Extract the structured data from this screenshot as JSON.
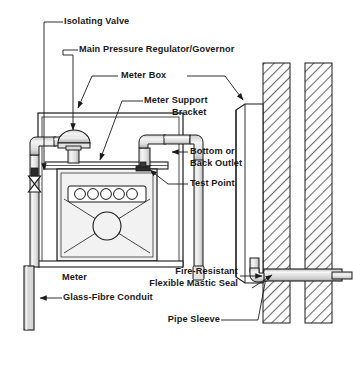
{
  "diagram": {
    "labels": {
      "isolating_valve": "Isolating Valve",
      "main_pressure_regulator": "Main Pressure Regulator/Governor",
      "meter_box": "Meter Box",
      "meter_support_bracket_l1": "Meter Support",
      "meter_support_bracket_l2": "Bracket",
      "bottom_or_back_outlet_l1": "Bottom or",
      "bottom_or_back_outlet_l2": "Back Outlet",
      "test_point": "Test Point",
      "meter": "Meter",
      "glass_fibre_conduit": "Glass-Fibre Conduit",
      "fire_resistant_seal_l1": "Fire-Resistant",
      "fire_resistant_seal_l2": "Flexible Mastic Seal",
      "pipe_sleeve": "Pipe Sleeve"
    },
    "colors": {
      "line": "#1a1a1a",
      "background": "#ffffff",
      "pipe_fill": "#e8e8e8",
      "pipe_shade": "#b8b8b8",
      "meter_fill": "#f2f2f2",
      "box_fill": "#ffffff",
      "wall_fill": "#ffffff",
      "hatch": "#6e6e6e",
      "conduit_fill": "#d8d8d8",
      "sleeve_fill": "#cfcfcf"
    },
    "meter_dial_count": 5,
    "wall_count": 2
  }
}
